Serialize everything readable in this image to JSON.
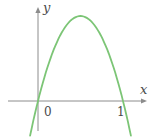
{
  "page": {
    "background": "#ffffff"
  },
  "chart_data": {
    "type": "line",
    "title": "",
    "xlabel": "x",
    "ylabel": "y",
    "legend": null,
    "grid": false,
    "curve_description": "downward-opening parabola through the origin",
    "opens": "down",
    "x_intercepts": [
      0,
      1
    ],
    "tick_labels": {
      "origin": "0",
      "right_intercept": "1"
    },
    "approx_function": "y ≈ 4·x·(1−x)",
    "x_range_drawn": [
      -0.093,
      1.093
    ],
    "vertex_math": {
      "x": 0.5,
      "y_relative": "maximum (axis unlabeled)"
    },
    "colors": {
      "curve": "#7cc576",
      "axis": "#8c8c8c",
      "label": "#4a4a4a",
      "background": "#ffffff"
    },
    "layout_hints": {
      "origin_px": [
        38,
        101
      ],
      "unit_px": 85,
      "x_axis_start_px": 8,
      "x_axis_end_px": 147,
      "y_axis_top_px": 7,
      "y_axis_bottom_px": 131,
      "samples": 64
    }
  }
}
